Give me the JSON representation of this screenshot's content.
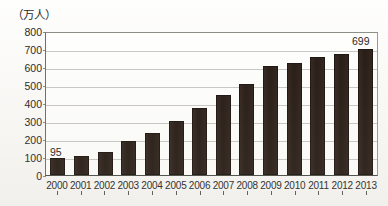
{
  "chart_data": {
    "type": "bar",
    "title": "",
    "subtitle": "",
    "unit_label": "（万人）",
    "xlabel": "",
    "ylabel": "",
    "ylim": [
      0,
      800
    ],
    "ytick_step": 100,
    "yticks": [
      "800",
      "700",
      "600",
      "500",
      "400",
      "300",
      "200",
      "100",
      "0"
    ],
    "grid": true,
    "legend": null,
    "bar_color": "#2a1f19",
    "categories": [
      "2000",
      "2001",
      "2002",
      "2003",
      "2004",
      "2005",
      "2006",
      "2007",
      "2008",
      "2009",
      "2010",
      "2011",
      "2012",
      "2013"
    ],
    "values": [
      95,
      103,
      130,
      187,
      235,
      302,
      375,
      443,
      507,
      607,
      625,
      655,
      673,
      699
    ],
    "annotations": [
      {
        "category": "2000",
        "value": 95,
        "text": "95"
      },
      {
        "category": "2013",
        "value": 699,
        "text": "699"
      }
    ]
  }
}
